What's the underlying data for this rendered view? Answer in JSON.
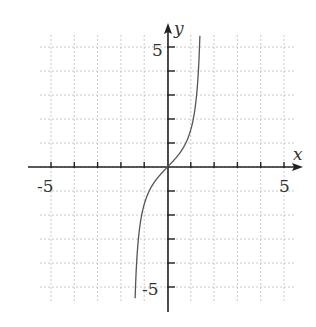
{
  "chart_data": {
    "type": "line",
    "title": "",
    "function": "y = tan(x)",
    "xlabel": "x",
    "ylabel": "y",
    "xlim": [
      -5.5,
      5.5
    ],
    "ylim": [
      -5.5,
      5.5
    ],
    "grid": true,
    "x_tick_labels": [
      {
        "value": -5,
        "label": "-5"
      },
      {
        "value": 5,
        "label": "5"
      }
    ],
    "y_tick_labels": [
      {
        "value": 5,
        "label": "5"
      },
      {
        "value": -5,
        "label": "-5"
      }
    ],
    "ticks": [
      -5,
      -4,
      -3,
      -2,
      -1,
      1,
      2,
      3,
      4,
      5
    ],
    "series": [
      {
        "name": "curve",
        "x": [
          -1.39,
          -1.35,
          -1.3,
          -1.2,
          -1.1,
          -1.0,
          -0.8,
          -0.6,
          -0.4,
          -0.2,
          0,
          0.2,
          0.4,
          0.6,
          0.8,
          1.0,
          1.1,
          1.2,
          1.3,
          1.35,
          1.39
        ],
        "y": [
          -5.53,
          -4.46,
          -3.6,
          -2.57,
          -1.96,
          -1.56,
          -1.03,
          -0.68,
          -0.42,
          -0.2,
          0,
          0.2,
          0.42,
          0.68,
          1.03,
          1.56,
          1.96,
          2.57,
          3.6,
          4.46,
          5.53
        ]
      }
    ],
    "colors": {
      "curve": "#555555",
      "axis": "#222222",
      "grid": "#bbbbbb"
    }
  },
  "labels": {
    "x_axis": "x",
    "y_axis": "y",
    "x_neg5": "-5",
    "x_pos5": "5",
    "y_pos5": "5",
    "y_neg5": "-5"
  }
}
